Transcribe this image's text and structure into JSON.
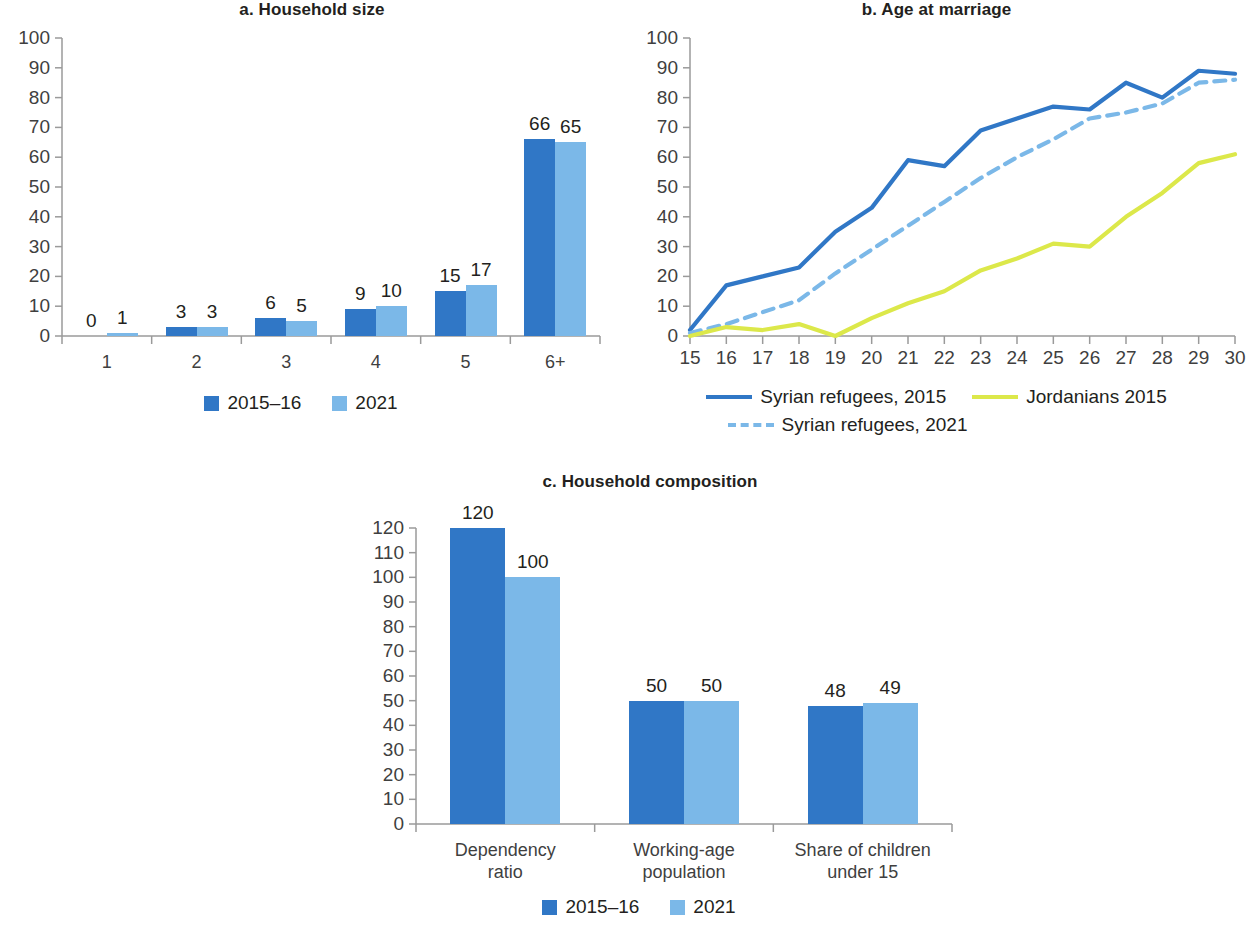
{
  "colors": {
    "dark_blue": "#3077C6",
    "light_blue": "#7BB8E8",
    "yellow_green": "#DCE84A",
    "axis": "#9a9a9a",
    "text": "#231f20"
  },
  "panels": {
    "a": {
      "title": "a. Household size",
      "legend": [
        {
          "label": "2015–16",
          "color_key": "dark_blue"
        },
        {
          "label": "2021",
          "color_key": "light_blue"
        }
      ]
    },
    "b": {
      "title": "b. Age at marriage",
      "legend": [
        {
          "label": "Syrian refugees, 2015",
          "style": "solid",
          "color_key": "dark_blue"
        },
        {
          "label": "Jordanians 2015",
          "style": "solid",
          "color_key": "yellow_green"
        },
        {
          "label": "Syrian refugees, 2021",
          "style": "dashed",
          "color_key": "light_blue"
        }
      ]
    },
    "c": {
      "title": "c. Household composition",
      "legend": [
        {
          "label": "2015–16",
          "color_key": "dark_blue"
        },
        {
          "label": "2021",
          "color_key": "light_blue"
        }
      ]
    }
  },
  "chart_data": [
    {
      "id": "a",
      "type": "bar",
      "title": "a. Household size",
      "xlabel": "",
      "ylabel": "",
      "ylim": [
        0,
        100
      ],
      "yticks": [
        0,
        10,
        20,
        30,
        40,
        50,
        60,
        70,
        80,
        90,
        100
      ],
      "ytick_labels": [
        "0",
        "10",
        "20",
        "30",
        "40",
        "50",
        "60",
        "70",
        "80",
        "90",
        "100"
      ],
      "grid": false,
      "legend_position": "bottom",
      "categories": [
        "1",
        "2",
        "3",
        "4",
        "5",
        "6+"
      ],
      "series": [
        {
          "name": "2015–16",
          "color": "#3077C6",
          "values": [
            0,
            3,
            6,
            9,
            15,
            66
          ],
          "labels": [
            "0",
            "3",
            "6",
            "9",
            "15",
            "66"
          ]
        },
        {
          "name": "2021",
          "color": "#7BB8E8",
          "values": [
            1,
            3,
            5,
            10,
            17,
            65
          ],
          "labels": [
            "1",
            "3",
            "5",
            "10",
            "17",
            "65"
          ]
        }
      ]
    },
    {
      "id": "b",
      "type": "line",
      "title": "b. Age at marriage",
      "xlabel": "",
      "ylabel": "",
      "xlim": [
        15,
        30
      ],
      "ylim": [
        0,
        100
      ],
      "yticks": [
        0,
        10,
        20,
        30,
        40,
        50,
        60,
        70,
        80,
        90,
        100
      ],
      "ytick_labels": [
        "0",
        "10",
        "20",
        "30",
        "40",
        "50",
        "60",
        "70",
        "80",
        "90",
        "100"
      ],
      "x": [
        15,
        16,
        17,
        18,
        19,
        20,
        21,
        22,
        23,
        24,
        25,
        26,
        27,
        28,
        29,
        30
      ],
      "xtick_labels": [
        "15",
        "16",
        "17",
        "18",
        "19",
        "20",
        "21",
        "22",
        "23",
        "24",
        "25",
        "26",
        "27",
        "28",
        "29",
        "30"
      ],
      "grid": false,
      "legend_position": "bottom",
      "series": [
        {
          "name": "Syrian refugees, 2015",
          "color": "#3077C6",
          "style": "solid",
          "values": [
            2,
            17,
            20,
            23,
            35,
            43,
            59,
            57,
            69,
            73,
            77,
            76,
            85,
            80,
            89,
            88
          ]
        },
        {
          "name": "Syrian refugees, 2021",
          "color": "#7BB8E8",
          "style": "dashed",
          "values": [
            1,
            4,
            8,
            12,
            21,
            29,
            37,
            45,
            53,
            60,
            66,
            73,
            75,
            78,
            85,
            86
          ]
        },
        {
          "name": "Jordanians 2015",
          "color": "#DCE84A",
          "style": "solid",
          "values": [
            0,
            3,
            2,
            4,
            0,
            6,
            11,
            15,
            22,
            26,
            31,
            30,
            40,
            48,
            58,
            61
          ]
        }
      ]
    },
    {
      "id": "c",
      "type": "bar",
      "title": "c. Household composition",
      "xlabel": "",
      "ylabel": "",
      "ylim": [
        0,
        120
      ],
      "yticks": [
        0,
        10,
        20,
        30,
        40,
        50,
        60,
        70,
        80,
        90,
        100,
        110,
        120
      ],
      "ytick_labels": [
        "0",
        "10",
        "20",
        "30",
        "40",
        "50",
        "60",
        "70",
        "80",
        "90",
        "100",
        "110",
        "120"
      ],
      "grid": false,
      "legend_position": "bottom",
      "categories": [
        "Dependency\nratio",
        "Working-age\npopulation",
        "Share of children\nunder 15"
      ],
      "series": [
        {
          "name": "2015–16",
          "color": "#3077C6",
          "values": [
            120,
            50,
            48
          ],
          "labels": [
            "120",
            "50",
            "48"
          ]
        },
        {
          "name": "2021",
          "color": "#7BB8E8",
          "values": [
            100,
            50,
            49
          ],
          "labels": [
            "100",
            "50",
            "49"
          ]
        }
      ]
    }
  ]
}
